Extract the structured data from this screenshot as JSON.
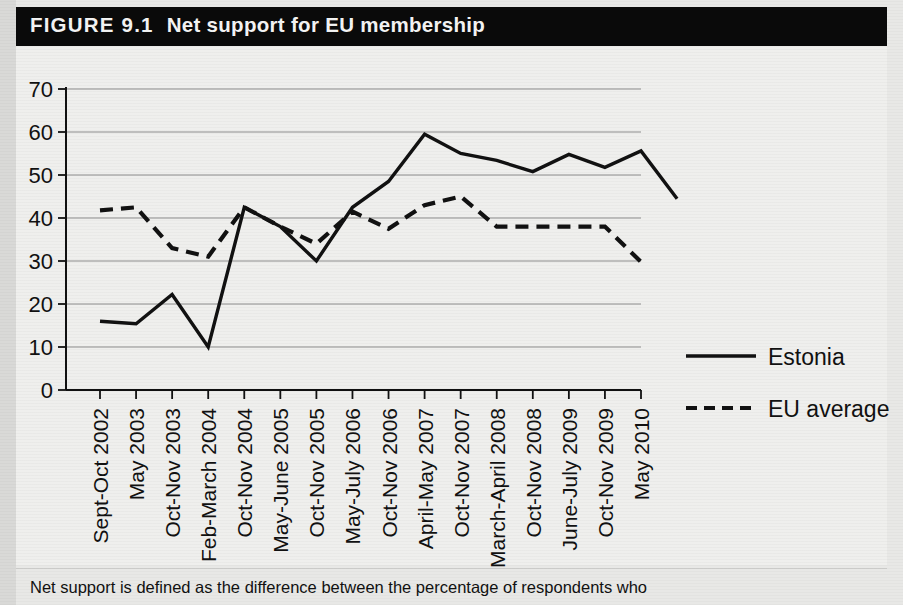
{
  "figure": {
    "number_label": "FIGURE 9.1",
    "title": "Net support for EU membership",
    "caption": "Net support is defined as the difference between the percentage of respondents who",
    "title_bar_color": "#0a0a0a",
    "title_text_color": "#f4f4f4",
    "panel_color": "#efefed",
    "line_color": "#111111"
  },
  "chart_data": {
    "type": "line",
    "title": "Net support for EU membership",
    "xlabel": "",
    "ylabel": "",
    "ylim": [
      0,
      70
    ],
    "yticks": [
      0,
      10,
      20,
      30,
      40,
      50,
      60,
      70
    ],
    "grid": true,
    "legend_position": "right",
    "categories": [
      "Sept-Oct 2002",
      "May 2003",
      "Oct-Nov 2003",
      "Feb-March 2004",
      "Oct-Nov 2004",
      "May-June 2005",
      "Oct-Nov 2005",
      "May-July 2006",
      "Oct-Nov 2006",
      "April-May 2007",
      "Oct-Nov 2007",
      "March-April 2008",
      "Oct-Nov 2008",
      "June-July 2009",
      "Oct-Nov 2009",
      "May 2010"
    ],
    "series": [
      {
        "name": "Estonia",
        "style": "solid",
        "values": [
          16,
          15.4,
          22.2,
          10,
          42.5,
          38,
          30,
          42.5,
          48.5,
          59.5,
          55,
          53.4,
          50.8,
          54.8,
          51.8,
          55.6
        ]
      },
      {
        "name": "EU average",
        "style": "dashed",
        "values": [
          41.8,
          42.5,
          33,
          31,
          42.5,
          38,
          34,
          41.5,
          37.5,
          43,
          45,
          38,
          38,
          38,
          38,
          29.8
        ]
      }
    ],
    "series_note": "Estonia has 17 plotted points; its final value at May 2010 is 44.5",
    "estonia_full_values": [
      16,
      15.4,
      22.2,
      10,
      42.5,
      38,
      30,
      42.5,
      48.5,
      59.5,
      55,
      53.4,
      50.8,
      54.8,
      51.8,
      55.6,
      44.5
    ]
  },
  "legend": {
    "items": [
      {
        "label": "Estonia",
        "style": "solid"
      },
      {
        "label": "EU average",
        "style": "dashed"
      }
    ]
  },
  "ghost_text": {
    "right_mid": "",
    "left_low": ""
  }
}
